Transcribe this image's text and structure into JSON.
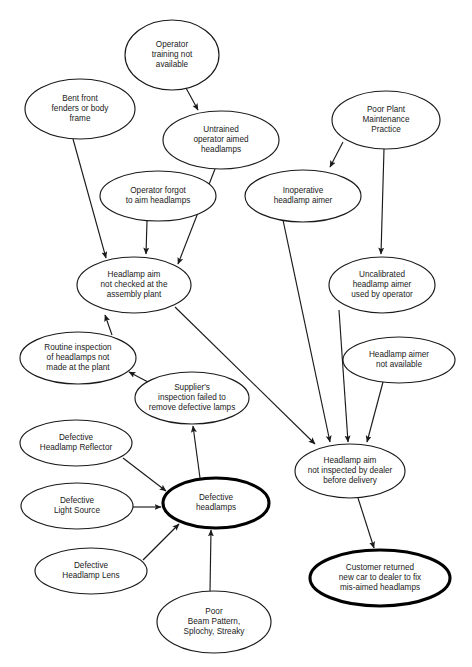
{
  "diagram": {
    "type": "causal-factor-tree",
    "style": {
      "background": "#ffffff",
      "node_fill": "#ffffff",
      "node_stroke": "#1a1a1a",
      "emphasis_stroke": "#000000",
      "edge_stroke": "#1a1a1a",
      "text_color": "#1a1a1a"
    },
    "top_clipped_text": "",
    "nodes": [
      {
        "id": "operator-training",
        "label": "Operator\ntraining not\navailable",
        "lines": [
          "Operator",
          "training not",
          "available"
        ],
        "cx": 172,
        "cy": 55,
        "rx": 47,
        "ry": 35,
        "emphasis": false
      },
      {
        "id": "bent-front-fenders",
        "label": "Bent front\nfenders or body\nframe",
        "lines": [
          "Bent front",
          "fenders or body",
          "frame"
        ],
        "cx": 80,
        "cy": 109,
        "rx": 55,
        "ry": 30,
        "emphasis": false
      },
      {
        "id": "poor-plant-maintenance",
        "label": "Poor Plant\nMaintenance\nPractice",
        "lines": [
          "Poor Plant",
          "Maintenance",
          "Practice"
        ],
        "cx": 386,
        "cy": 120,
        "rx": 54,
        "ry": 29,
        "emphasis": false
      },
      {
        "id": "untrained-operator",
        "label": "Untrained\noperator aimed\nheadlamps",
        "lines": [
          "Untrained",
          "operator aimed",
          "headlamps"
        ],
        "cx": 221,
        "cy": 140,
        "rx": 58,
        "ry": 29,
        "emphasis": false
      },
      {
        "id": "operator-forgot",
        "label": "Operator forgot\nto aim headlamps",
        "lines": [
          "Operator forgot",
          "to aim headlamps"
        ],
        "cx": 158,
        "cy": 196,
        "rx": 58,
        "ry": 25,
        "emphasis": false
      },
      {
        "id": "inoperative-aimer",
        "label": "Inoperative\nheadlamp aimer",
        "lines": [
          "Inoperative",
          "headlamp aimer"
        ],
        "cx": 303,
        "cy": 196,
        "rx": 58,
        "ry": 26,
        "emphasis": false
      },
      {
        "id": "aim-not-checked-plant",
        "label": "Headlamp aim\nnot checked at the\nassembly plant",
        "lines": [
          "Headlamp aim",
          "not checked at the",
          "assembly plant"
        ],
        "cx": 134,
        "cy": 285,
        "rx": 57,
        "ry": 28,
        "emphasis": false
      },
      {
        "id": "uncalibrated-aimer",
        "label": "Uncalibrated\nheadlamp aimer\nused by operator",
        "lines": [
          "Uncalibrated",
          "headlamp aimer",
          "used by operator"
        ],
        "cx": 382,
        "cy": 285,
        "rx": 53,
        "ry": 28,
        "emphasis": false
      },
      {
        "id": "routine-inspection",
        "label": "Routine inspection\nof headlamps not\nmade at the plant",
        "lines": [
          "Routine inspection",
          "of headlamps not",
          "made at the plant"
        ],
        "cx": 78,
        "cy": 358,
        "rx": 58,
        "ry": 26,
        "emphasis": false
      },
      {
        "id": "headlamp-aimer-not-available",
        "label": "Headlamp aimer\nnot available",
        "lines": [
          "Headlamp aimer",
          "not available"
        ],
        "cx": 399,
        "cy": 360,
        "rx": 56,
        "ry": 23,
        "emphasis": false
      },
      {
        "id": "supplier-inspection-failed",
        "label": "Supplier's\ninspection failed to\nremove defective lamps",
        "lines": [
          "Supplier's",
          "inspection failed to",
          "remove defective lamps"
        ],
        "cx": 192,
        "cy": 398,
        "rx": 57,
        "ry": 26,
        "emphasis": false
      },
      {
        "id": "defective-headlamp-reflector",
        "label": "Defective\nHeadlamp Reflector",
        "lines": [
          "Defective",
          "Headlamp Reflector"
        ],
        "cx": 76,
        "cy": 443,
        "rx": 56,
        "ry": 23,
        "emphasis": false
      },
      {
        "id": "aim-not-inspected-dealer",
        "label": "Headlamp aim\nnot inspected by dealer\nbefore delivery",
        "lines": [
          "Headlamp aim",
          "not inspected by dealer",
          "before delivery"
        ],
        "cx": 350,
        "cy": 471,
        "rx": 55,
        "ry": 27,
        "emphasis": false
      },
      {
        "id": "defective-light-source",
        "label": "Defective\nLight Source",
        "lines": [
          "Defective",
          "Light Source"
        ],
        "cx": 77,
        "cy": 506,
        "rx": 56,
        "ry": 23,
        "emphasis": false
      },
      {
        "id": "defective-headlamps",
        "label": "Defective\nheadlamps",
        "lines": [
          "Defective",
          "headlamps"
        ],
        "cx": 216,
        "cy": 503,
        "rx": 53,
        "ry": 25,
        "emphasis": true
      },
      {
        "id": "defective-headlamp-lens",
        "label": "Defective\nHeadlamp Lens",
        "lines": [
          "Defective",
          "Headlamp Lens"
        ],
        "cx": 91,
        "cy": 571,
        "rx": 56,
        "ry": 23,
        "emphasis": false
      },
      {
        "id": "customer-returned",
        "label": "Customer returned\nnew car to dealer to fix\nmis-aimed headlamps",
        "lines": [
          "Customer returned",
          "new car to dealer to fix",
          "mis-aimed headlamps"
        ],
        "cx": 380,
        "cy": 578,
        "rx": 70,
        "ry": 28,
        "emphasis": true
      },
      {
        "id": "poor-beam-pattern",
        "label": "Poor\nBeam Pattern,\nSplochy, Streaky",
        "lines": [
          "Poor",
          "Beam Pattern,",
          "Splochy, Streaky"
        ],
        "cx": 214,
        "cy": 622,
        "rx": 57,
        "ry": 31,
        "emphasis": false
      }
    ],
    "edges": [
      {
        "id": "e1",
        "from": "operator-training",
        "to": "untrained-operator",
        "x1": 186,
        "y1": 88,
        "x2": 198,
        "y2": 110
      },
      {
        "id": "e2",
        "from": "bent-front-fenders",
        "to": "aim-not-checked-plant",
        "x1": 73,
        "y1": 139,
        "x2": 106,
        "y2": 258
      },
      {
        "id": "e3",
        "from": "poor-plant-maintenance",
        "to": "inoperative-aimer",
        "x1": 343,
        "y1": 142,
        "x2": 330,
        "y2": 167
      },
      {
        "id": "e4",
        "from": "poor-plant-maintenance",
        "to": "uncalibrated-aimer",
        "x1": 384,
        "y1": 149,
        "x2": 381,
        "y2": 254
      },
      {
        "id": "e5",
        "from": "untrained-operator",
        "to": "aim-not-checked-plant",
        "x1": 215,
        "y1": 169,
        "x2": 178,
        "y2": 264
      },
      {
        "id": "e6",
        "from": "operator-forgot",
        "to": "aim-not-checked-plant",
        "x1": 147,
        "y1": 221,
        "x2": 146,
        "y2": 254
      },
      {
        "id": "e7",
        "from": "inoperative-aimer",
        "to": "aim-not-inspected-dealer",
        "x1": 283,
        "y1": 220,
        "x2": 330,
        "y2": 442
      },
      {
        "id": "e8",
        "from": "uncalibrated-aimer",
        "to": "aim-not-inspected-dealer",
        "x1": 339,
        "y1": 310,
        "x2": 348,
        "y2": 442
      },
      {
        "id": "e9",
        "from": "routine-inspection",
        "to": "aim-not-checked-plant",
        "x1": 112,
        "y1": 335,
        "x2": 105,
        "y2": 315
      },
      {
        "id": "e10",
        "from": "aim-not-checked-plant",
        "to": "aim-not-inspected-dealer",
        "x1": 175,
        "y1": 307,
        "x2": 315,
        "y2": 444
      },
      {
        "id": "e11",
        "from": "headlamp-aimer-not-available",
        "to": "aim-not-inspected-dealer",
        "x1": 383,
        "y1": 382,
        "x2": 367,
        "y2": 442
      },
      {
        "id": "e12",
        "from": "supplier-inspection-failed",
        "to": "routine-inspection",
        "x1": 148,
        "y1": 382,
        "x2": 129,
        "y2": 372
      },
      {
        "id": "e13",
        "from": "defective-headlamps",
        "to": "supplier-inspection-failed",
        "x1": 200,
        "y1": 478,
        "x2": 193,
        "y2": 426
      },
      {
        "id": "e14",
        "from": "defective-headlamp-reflector",
        "to": "defective-headlamps",
        "x1": 123,
        "y1": 458,
        "x2": 166,
        "y2": 491
      },
      {
        "id": "e15",
        "from": "defective-light-source",
        "to": "defective-headlamps",
        "x1": 133,
        "y1": 507,
        "x2": 161,
        "y2": 507
      },
      {
        "id": "e16",
        "from": "defective-headlamp-lens",
        "to": "defective-headlamps",
        "x1": 143,
        "y1": 560,
        "x2": 179,
        "y2": 524
      },
      {
        "id": "e17",
        "from": "poor-beam-pattern",
        "to": "defective-headlamps",
        "x1": 210,
        "y1": 591,
        "x2": 211,
        "y2": 530
      },
      {
        "id": "e18",
        "from": "aim-not-inspected-dealer",
        "to": "customer-returned",
        "x1": 358,
        "y1": 498,
        "x2": 374,
        "y2": 548
      }
    ]
  }
}
